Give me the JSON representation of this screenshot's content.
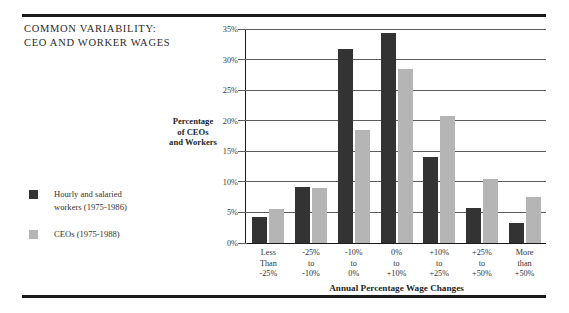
{
  "figure": {
    "title_lines": [
      "COMMON  VARIABILITY:",
      "CEO  AND  WORKER  WAGES"
    ],
    "colors": {
      "series_workers": "#333333",
      "series_ceos": "#b5b5b5",
      "rule": "#1a1a1a",
      "gridline": "#5d5d5d",
      "background": "#ffffff"
    }
  },
  "legend": {
    "position": "left-middle",
    "entries": [
      {
        "swatch_name": "legend-swatch-workers",
        "color": "#333333",
        "lines": [
          "Hourly and salaried",
          "workers (1975-1986)"
        ]
      },
      {
        "swatch_name": "legend-swatch-ceos",
        "color": "#b5b5b5",
        "lines": [
          "CEOs (1975-1988)"
        ]
      }
    ]
  },
  "axes": {
    "y_title_lines": [
      "Percentage",
      "of CEOs",
      "and Workers"
    ],
    "x_title": "Annual Percentage Wage Changes",
    "y_ticks": [
      "0%",
      "5%",
      "10%",
      "15%",
      "20%",
      "25%",
      "30%",
      "35%"
    ],
    "x_tick_lines": [
      [
        "Less",
        "Than",
        "-25%"
      ],
      [
        "-25%",
        "to",
        "-10%"
      ],
      [
        "-10%",
        "to",
        "0%"
      ],
      [
        "0%",
        "to",
        "+10%"
      ],
      [
        "+10%",
        "to",
        "+25%"
      ],
      [
        "+25%",
        "to",
        "+50%"
      ],
      [
        "More",
        "than",
        "+50%"
      ]
    ]
  },
  "chart_data": {
    "type": "bar",
    "title": "COMMON VARIABILITY: CEO AND WORKER WAGES",
    "xlabel": "Annual Percentage Wage Changes",
    "ylabel": "Percentage of CEOs and Workers",
    "ylim": [
      0,
      35
    ],
    "ytick_step": 5,
    "grid": true,
    "legend_position": "left-middle",
    "categories": [
      "Less Than -25%",
      "-25% to -10%",
      "-10% to 0%",
      "0% to +10%",
      "+10% to +25%",
      "+25% to +50%",
      "More than +50%"
    ],
    "series": [
      {
        "name": "Hourly and salaried workers (1975-1986)",
        "color": "#333333",
        "values": [
          4.3,
          9.1,
          31.8,
          34.4,
          14.0,
          5.8,
          3.2
        ]
      },
      {
        "name": "CEOs (1975-1988)",
        "color": "#b5b5b5",
        "values": [
          5.6,
          9.0,
          18.5,
          28.5,
          20.7,
          10.4,
          7.6
        ]
      }
    ]
  }
}
